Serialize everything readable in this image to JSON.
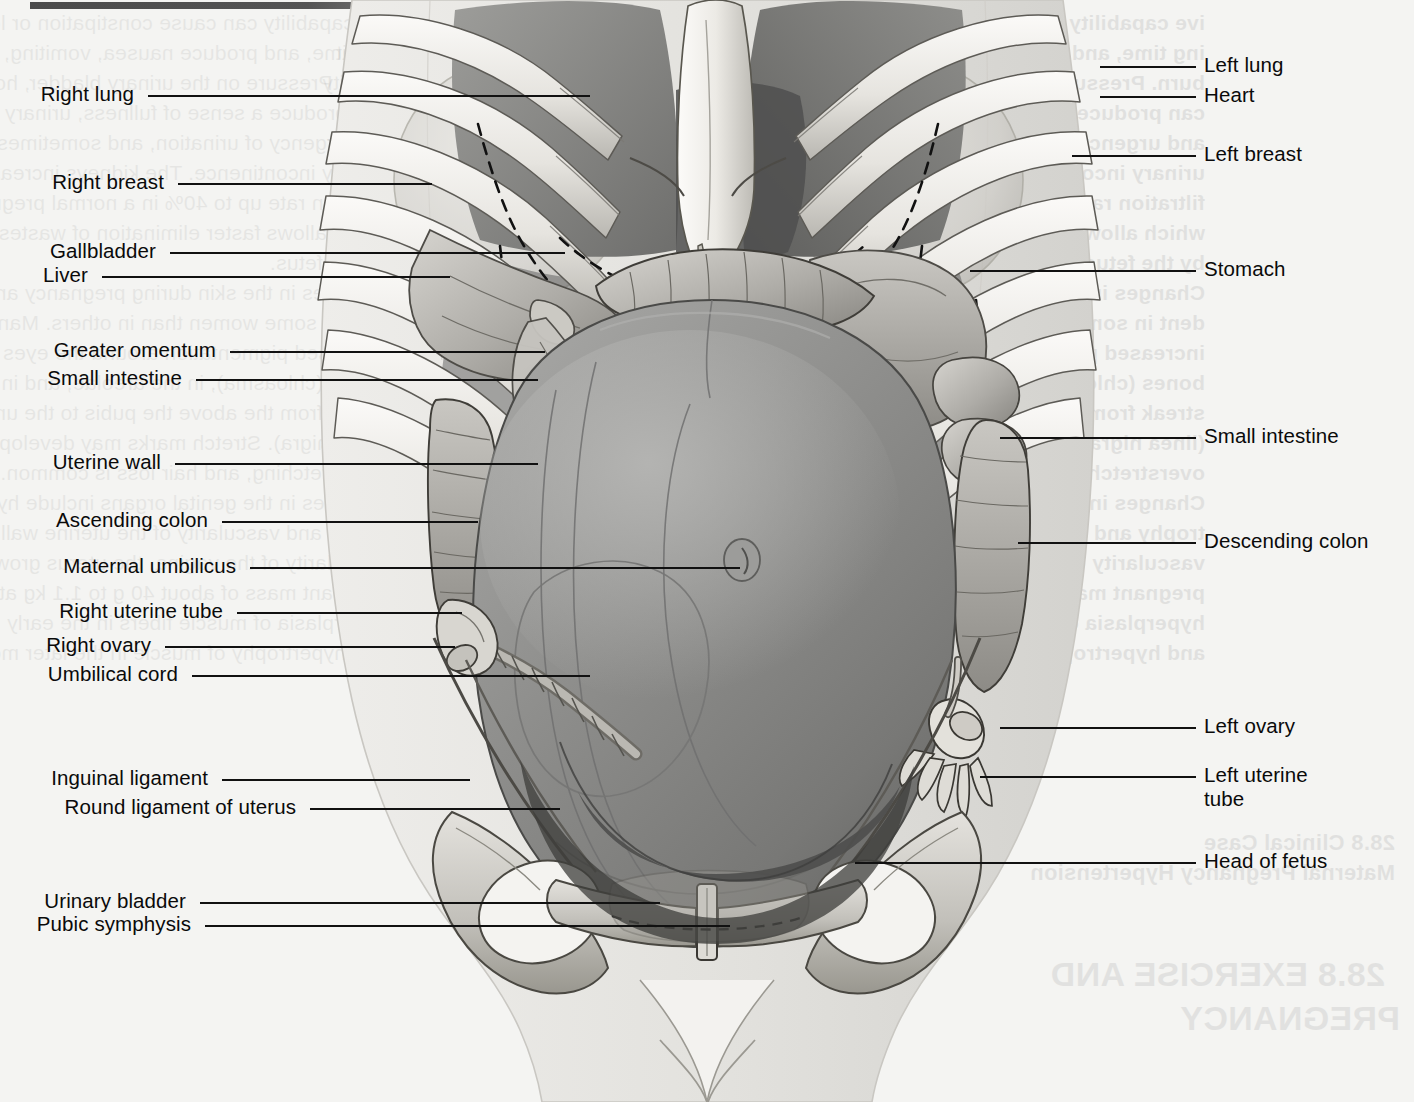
{
  "figure": {
    "kind": "anatomical-illustration",
    "orientation": "anterior view"
  },
  "top_rule": {
    "name": "page-top-rule"
  },
  "labels_left": [
    {
      "id": "right-lung",
      "text": "Right lung",
      "x": 40,
      "y": 95,
      "line_x1": 148,
      "line_x2": 590,
      "line_y": 95
    },
    {
      "id": "right-breast",
      "text": "Right breast",
      "x": 40,
      "y": 183,
      "line_x1": 178,
      "line_x2": 432,
      "line_y": 183
    },
    {
      "id": "gallbladder",
      "text": "Gallbladder",
      "x": 40,
      "y": 252,
      "line_x1": 170,
      "line_x2": 565,
      "line_y": 252
    },
    {
      "id": "liver",
      "text": "Liver",
      "x": 40,
      "y": 276,
      "line_x1": 102,
      "line_x2": 450,
      "line_y": 276
    },
    {
      "id": "greater-omentum",
      "text": "Greater omentum",
      "x": 40,
      "y": 351,
      "line_x1": 230,
      "line_x2": 545,
      "line_y": 351
    },
    {
      "id": "small-intestine-left",
      "text": "Small intestine",
      "x": 40,
      "y": 379,
      "line_x1": 196,
      "line_x2": 538,
      "line_y": 379
    },
    {
      "id": "uterine-wall",
      "text": "Uterine wall",
      "x": 40,
      "y": 463,
      "line_x1": 175,
      "line_x2": 538,
      "line_y": 463
    },
    {
      "id": "ascending-colon",
      "text": "Ascending colon",
      "x": 40,
      "y": 521,
      "line_x1": 222,
      "line_x2": 478,
      "line_y": 521
    },
    {
      "id": "maternal-umbilicus",
      "text": "Maternal umbilicus",
      "x": 40,
      "y": 567,
      "line_x1": 250,
      "line_x2": 740,
      "line_y": 567
    },
    {
      "id": "right-uterine-tube",
      "text": "Right uterine tube",
      "x": 40,
      "y": 612,
      "line_x1": 237,
      "line_x2": 462,
      "line_y": 612
    },
    {
      "id": "right-ovary",
      "text": "Right ovary",
      "x": 40,
      "y": 646,
      "line_x1": 165,
      "line_x2": 455,
      "line_y": 646
    },
    {
      "id": "umbilical-cord",
      "text": "Umbilical cord",
      "x": 40,
      "y": 675,
      "line_x1": 192,
      "line_x2": 590,
      "line_y": 675
    },
    {
      "id": "inguinal-ligament",
      "text": "Inguinal ligament",
      "x": 40,
      "y": 779,
      "line_x1": 222,
      "line_x2": 470,
      "line_y": 779
    },
    {
      "id": "round-ligament-uterus",
      "text": "Round ligament of uterus",
      "x": 40,
      "y": 808,
      "line_x1": 310,
      "line_x2": 560,
      "line_y": 808
    },
    {
      "id": "urinary-bladder",
      "text": "Urinary bladder",
      "x": 40,
      "y": 902,
      "line_x1": 200,
      "line_x2": 660,
      "line_y": 902
    },
    {
      "id": "pubic-symphysis",
      "text": "Pubic symphysis",
      "x": 40,
      "y": 925,
      "line_x1": 205,
      "line_x2": 730,
      "line_y": 925
    }
  ],
  "labels_right": [
    {
      "id": "left-lung",
      "text": "Left lung",
      "x": 1204,
      "y": 66,
      "line_x1": 1100,
      "line_x2": 1196,
      "line_y": 66
    },
    {
      "id": "heart",
      "text": "Heart",
      "x": 1204,
      "y": 96,
      "line_x1": 1100,
      "line_x2": 1196,
      "line_y": 96
    },
    {
      "id": "left-breast",
      "text": "Left breast",
      "x": 1204,
      "y": 155,
      "line_x1": 1072,
      "line_x2": 1196,
      "line_y": 155
    },
    {
      "id": "stomach",
      "text": "Stomach",
      "x": 1204,
      "y": 270,
      "line_x1": 970,
      "line_x2": 1196,
      "line_y": 270
    },
    {
      "id": "small-intestine-right",
      "text": "Small intestine",
      "x": 1204,
      "y": 437,
      "line_x1": 1000,
      "line_x2": 1196,
      "line_y": 437
    },
    {
      "id": "descending-colon",
      "text": "Descending colon",
      "x": 1204,
      "y": 542,
      "line_x1": 1018,
      "line_x2": 1196,
      "line_y": 542
    },
    {
      "id": "left-ovary",
      "text": "Left ovary",
      "x": 1204,
      "y": 727,
      "line_x1": 1000,
      "line_x2": 1196,
      "line_y": 727
    },
    {
      "id": "left-uterine-tube",
      "text": "Left uterine\ntube",
      "x": 1204,
      "y": 776,
      "line_x1": 980,
      "line_x2": 1196,
      "line_y": 776
    },
    {
      "id": "head-of-fetus",
      "text": "Head of fetus",
      "x": 1204,
      "y": 862,
      "line_x1": 855,
      "line_x2": 1196,
      "line_y": 862
    }
  ],
  "bleed_text": {
    "note": "faint mirrored show-through text from the reverse side of the printed page",
    "left_col": [
      "ive capability can cause constipation or lead empty-",
      "ing time, and produce nausea, vomiting, or heart-",
      "burn. Pressure on the urinary bladder, however,",
      "can produce a sense of fullness, urinary frequency,",
      "and urgency of urination, and sometimes stress",
      "urinary incontinence. The kidneys increase their",
      "filtration rate up to 40% in a normal pregnancy,",
      "which allows faster elimination of wastes produced",
      "by the fetus.",
      "Changes in the skin during pregnancy are evi-",
      "dent in some women than in others. Many show",
      "increased pigmentation around the eyes and cheek-",
      "bones (chloasma), in the areolae, and in a midline",
      "streak from the above the pubis to the umbilicus",
      "(linea nigra). Stretch marks may develop from",
      "overstretching, and hair loss is common.",
      "Changes in the genital organs include hyper-",
      "trophy and vascularity of the uterine wall, increased",
      "vascularity of the vagina, the uterus grows from a",
      "pregnant mass of about 40 g to 1.1 kg at term by",
      "hyperplasia of muscle fibers in the early months",
      "and hypertrophy of muscle in the later months of"
    ],
    "right_col": [
      "Exercise has no known effect on fertility or",
      "harming the fetus. A woman who wears a bra that",
      "provides good support, and whose physical activity",
      "does not endanger the fetus during a normal",
      "pregnancy, however, exercise that might endanger",
      "the fetus should be avoided.",
      "Exercise appears to provide an increased sense",
      "of well-being, and fewer physical complaints.",
      "Labor is associated with the three stages",
      "described above.",
      "The fetus is expelled through the vagina, also",
      "referred to as birth, a process determined by",
      "complex interactions, especially near term, as",
      "progesterone are diminished. Toward the end",
      "of pregnancy, the levels of estrogen in the mother's",
      "blood rise, producing effects that overcome the",
      "inhibitory effect of progesterone.",
      "Stretching of the cervix stimulates secretion of",
      "oxytocin, which stimulates the anterior pituitary",
      "gland of the fetus to secrete adrenocorticotropic",
      "hormone (ACTH). In turn, ACTH stimulates the",
      "fetal suprarenal gland to secrete cortisol."
    ],
    "heading_small_1": "28.8 Clinical Case",
    "heading_small_2": "Maternal Pregnancy Hypertension",
    "heading_big_1": "28.8 EXERCISE AND",
    "heading_big_2": "PREGNANCY"
  },
  "palette": {
    "page_background": "#f4f4f2",
    "label_text": "#0a0a0a",
    "leader_line": "#111111",
    "bone_light": "#f2f1ee",
    "bone_mid": "#d4d2cd",
    "bone_shadow": "#a9a7a2",
    "cavity_dark": "#4f4f4f",
    "uterus_mid": "#8e8e8e",
    "uterus_light": "#a9a9a9",
    "uterus_dark": "#6f6f6f",
    "viscera_mid": "#b9b9b6",
    "viscera_dark": "#7e7e7c",
    "skin_outline": "#dcdbd7",
    "outline_stroke": "#3a3a3a"
  },
  "illustration_parts": [
    {
      "name": "rib-cage",
      "count": 14
    },
    {
      "name": "sternum-xiphoid-process"
    },
    {
      "name": "right-lung-field"
    },
    {
      "name": "left-lung-field"
    },
    {
      "name": "heart-shadow"
    },
    {
      "name": "right-breast-outline"
    },
    {
      "name": "left-breast-outline"
    },
    {
      "name": "diaphragm-dashed-line"
    },
    {
      "name": "liver"
    },
    {
      "name": "gallbladder"
    },
    {
      "name": "stomach"
    },
    {
      "name": "greater-omentum"
    },
    {
      "name": "transverse-colon"
    },
    {
      "name": "ascending-colon"
    },
    {
      "name": "descending-colon"
    },
    {
      "name": "small-intestine-loops"
    },
    {
      "name": "gravid-uterus"
    },
    {
      "name": "uterine-wall-highlight"
    },
    {
      "name": "maternal-umbilicus"
    },
    {
      "name": "umbilical-cord"
    },
    {
      "name": "right-uterine-tube"
    },
    {
      "name": "right-ovary"
    },
    {
      "name": "left-uterine-tube-fimbriae"
    },
    {
      "name": "left-ovary"
    },
    {
      "name": "inguinal-ligament"
    },
    {
      "name": "round-ligament-of-uterus"
    },
    {
      "name": "pelvis-ilium-left"
    },
    {
      "name": "pelvis-ilium-right"
    },
    {
      "name": "pubic-symphysis"
    },
    {
      "name": "urinary-bladder"
    },
    {
      "name": "head-of-fetus"
    },
    {
      "name": "body-silhouette"
    }
  ]
}
